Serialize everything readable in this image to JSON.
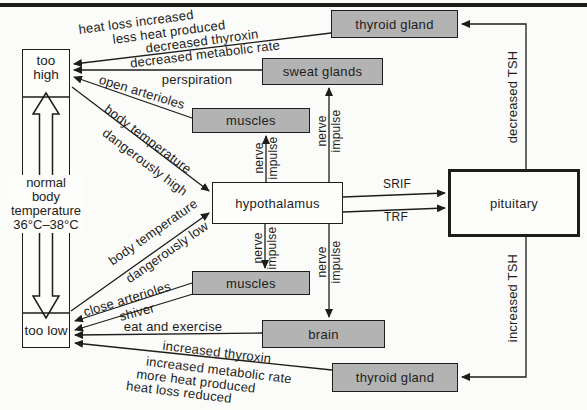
{
  "colors": {
    "box_gray": "#b3b3b3",
    "line_black": "#1d1d1b",
    "background": "#fbfbf9"
  },
  "scale": {
    "too_high": "too high",
    "too_low": "too low",
    "normal_lines": [
      "normal",
      "body",
      "temperature",
      "36°C–38°C"
    ]
  },
  "boxes": {
    "thyroid_top": "thyroid gland",
    "sweat_glands": "sweat glands",
    "muscles_top": "muscles",
    "hypothalamus": "hypothalamus",
    "pituitary": "pituitary",
    "muscles_bottom": "muscles",
    "brain": "brain",
    "thyroid_bottom": "thyroid gland"
  },
  "edge_labels": {
    "heat_loss_increased": "heat loss increased",
    "less_heat_produced": "less heat produced",
    "decreased_thyroxin": "decreased thyroxin",
    "decreased_metabolic_rate": "decreased metabolic rate",
    "perspiration": "perspiration",
    "open_arterioles": "open arterioles",
    "body_temperature_high_1": "body temperature",
    "body_temperature_high_2": "dangerously high",
    "body_temperature_low_1": "body temperature",
    "body_temperature_low_2": "dangerously low",
    "close_arterioles": "close arterioles",
    "shiver": "shiver",
    "eat_and_exercise": "eat and exercise",
    "increased_thyroxin": "increased thyroxin",
    "increased_metabolic_rate": "increased metabolic rate",
    "more_heat_produced": "more heat produced",
    "heat_loss_reduced": "heat loss reduced",
    "srif": "SRIF",
    "trf": "TRF",
    "decreased_tsh": "decreased TSH",
    "increased_tsh": "increased TSH",
    "nerve_impulse": {
      "word1": "nerve",
      "word2": "impulse"
    }
  }
}
